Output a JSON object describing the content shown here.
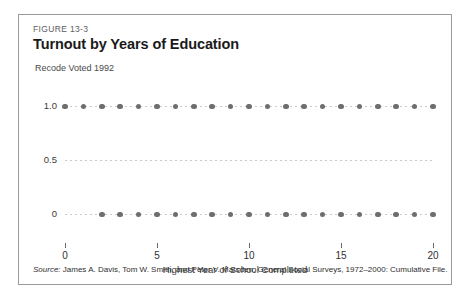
{
  "figure": {
    "number": "FIGURE 13-3",
    "title": "Turnout by Years of Education",
    "source_label": "Source:",
    "source_text": " James A. Davis, Tom W. Smith, and Peter V. Marsden, General Social Surveys, 1972–2000: Cumulative File."
  },
  "colors": {
    "frame_border": "#9a9a9a",
    "dot": "#6e6e6e",
    "gridline": "#c9c9c9",
    "title_text": "#1a1a1a",
    "label_text": "#3a3a3a"
  },
  "chart_data": {
    "type": "scatter",
    "title": "Turnout by Years of Education",
    "xlabel": "Highest Year of School Completed",
    "ylabel": "Recode Voted 1992",
    "xlim": [
      0,
      20
    ],
    "ylim": [
      0,
      1
    ],
    "grid": true,
    "legend": "none",
    "xticks": [
      0,
      5,
      10,
      15,
      20
    ],
    "xtick_labels": [
      "0",
      "5",
      "10",
      "15",
      "20"
    ],
    "yticks": [
      0,
      0.5,
      1.0
    ],
    "ytick_labels": [
      "0",
      "0.5",
      "1.0"
    ],
    "series": [
      {
        "name": "Voted (1.0)",
        "y": 1.0,
        "x": [
          0,
          1,
          2,
          3,
          4,
          5,
          6,
          7,
          8,
          9,
          10,
          11,
          12,
          13,
          14,
          15,
          16,
          17,
          18,
          19,
          20
        ]
      },
      {
        "name": "Did not vote (0)",
        "y": 0.0,
        "x": [
          2,
          3,
          4,
          5,
          6,
          7,
          8,
          9,
          10,
          11,
          12,
          13,
          14,
          15,
          16,
          17,
          18,
          19,
          20
        ]
      }
    ]
  }
}
